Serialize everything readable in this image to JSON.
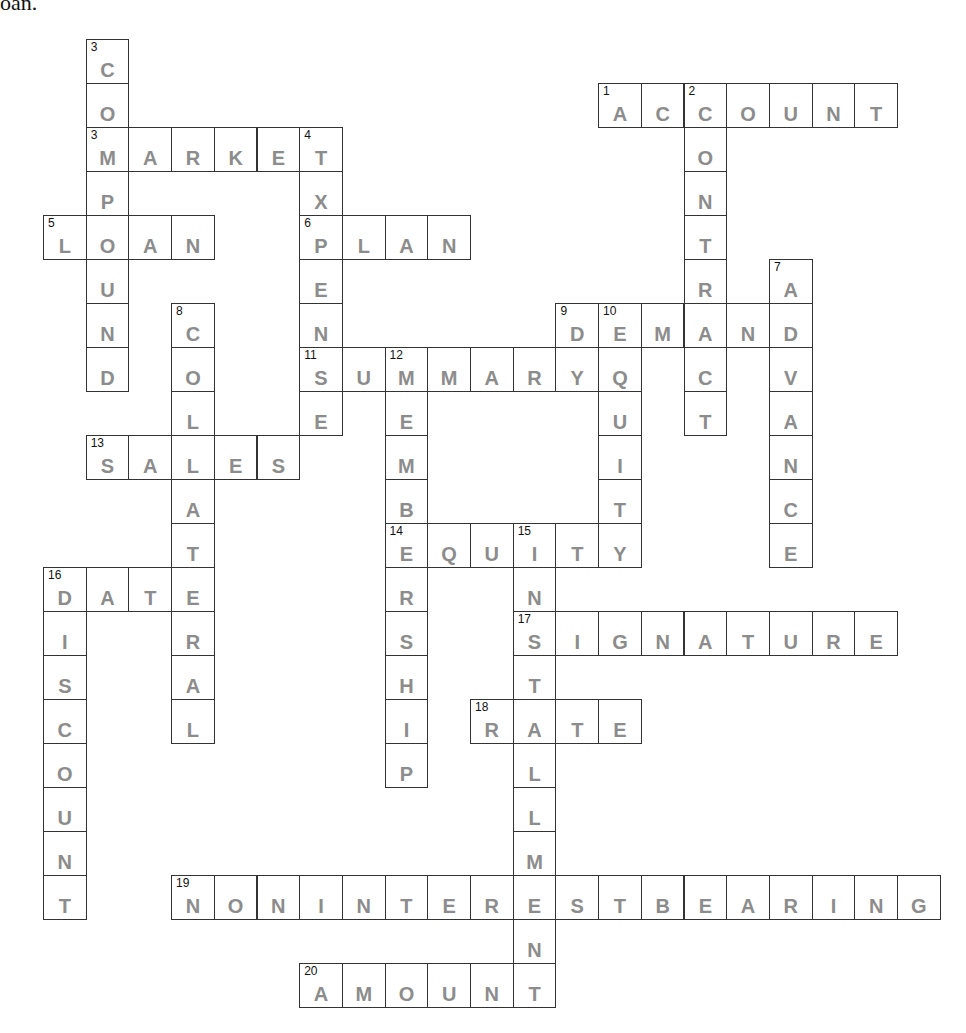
{
  "header_fragment": "oan.",
  "colors": {
    "letter": "#8c8c8c",
    "border": "#333333",
    "number": "#111111"
  },
  "grid": {
    "origin_x": 43,
    "origin_y": 39,
    "cell_w": 42.7,
    "cell_h": 44
  },
  "words": [
    {
      "num": "1",
      "answer": "ACCOUNT",
      "dir": "across",
      "col": 13,
      "row": 1
    },
    {
      "num": "2",
      "answer": "CONTRACT",
      "dir": "down",
      "col": 15,
      "row": 1
    },
    {
      "num": "3",
      "answer": "COMPOUND",
      "dir": "down",
      "col": 1,
      "row": 0
    },
    {
      "num": "3",
      "answer": "MARKET",
      "dir": "across",
      "col": 1,
      "row": 2
    },
    {
      "num": "4",
      "answer": "EXPENSE",
      "dir": "down",
      "col": 6,
      "row": 2
    },
    {
      "num": "5",
      "answer": "LOAN",
      "dir": "across",
      "col": 0,
      "row": 4
    },
    {
      "num": "6",
      "answer": "PLAN",
      "dir": "across",
      "col": 6,
      "row": 4
    },
    {
      "num": "7",
      "answer": "ADVANCE",
      "dir": "down",
      "col": 17,
      "row": 5
    },
    {
      "num": "8",
      "answer": "COLLATERAL",
      "dir": "down",
      "col": 3,
      "row": 6
    },
    {
      "num": "9",
      "answer": "DEMAND",
      "dir": "across",
      "col": 12,
      "row": 6
    },
    {
      "num": "10",
      "answer": "EQUITY",
      "dir": "down",
      "col": 13,
      "row": 6
    },
    {
      "num": "11",
      "answer": "SUMMARY",
      "dir": "across",
      "col": 6,
      "row": 7
    },
    {
      "num": "12",
      "answer": "MEMBERSHIP",
      "dir": "down",
      "col": 8,
      "row": 7
    },
    {
      "num": "13",
      "answer": "SALES",
      "dir": "across",
      "col": 1,
      "row": 9
    },
    {
      "num": "14",
      "answer": "EQUITY",
      "dir": "across",
      "col": 8,
      "row": 11
    },
    {
      "num": "15",
      "answer": "INSTALLMENT",
      "dir": "down",
      "col": 11,
      "row": 11
    },
    {
      "num": "16",
      "answer": "DATE",
      "dir": "across",
      "col": 0,
      "row": 12
    },
    {
      "num": "16",
      "answer": "DISCOUNT",
      "dir": "down",
      "col": 0,
      "row": 12
    },
    {
      "num": "17",
      "answer": "SIGNATURE",
      "dir": "across",
      "col": 11,
      "row": 13
    },
    {
      "num": "18",
      "answer": "RATE",
      "dir": "across",
      "col": 10,
      "row": 15
    },
    {
      "num": "19",
      "answer": "NONINTERESTBEARING",
      "dir": "across",
      "col": 3,
      "row": 19
    },
    {
      "num": "20",
      "answer": "AMOUNT",
      "dir": "across",
      "col": 6,
      "row": 21
    }
  ]
}
